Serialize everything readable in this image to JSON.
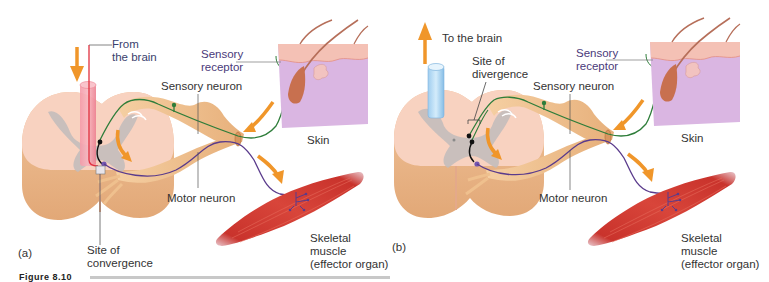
{
  "figure": {
    "colors": {
      "spinal_cord": "#f6c9b5",
      "spinal_cord_side": "#e9b58f",
      "gray_matter": "#bdb8b8",
      "nerve": "#efc08e",
      "sensory_neuron": "#2e7d3a",
      "motor_neuron": "#5a3b8c",
      "interneuron": "#111111",
      "arrow": "#f0962a",
      "descending_tract": "#f08a9a",
      "ascending_tract": "#a9d4f2",
      "skin_top": "#f6bfb3",
      "skin_body": "#d7b2df",
      "muscle": "#d6382f"
    },
    "panels": [
      {
        "id": "a",
        "panel_label": "(a)",
        "tract_label": "From\nthe brain",
        "tract_label_line1": "From",
        "tract_label_line2": "the brain",
        "site_label_line1": "Site of",
        "site_label_line2": "convergence",
        "sensory_receptor_line1": "Sensory",
        "sensory_receptor_line2": "receptor",
        "sensory_neuron": "Sensory neuron",
        "motor_neuron": "Motor neuron",
        "skin": "Skin",
        "muscle_line1": "Skeletal",
        "muscle_line2": "muscle",
        "muscle_line3": "(effector organ)"
      },
      {
        "id": "b",
        "panel_label": "(b)",
        "tract_label_line1": "To the brain",
        "site_label_line1": "Site of",
        "site_label_line2": "divergence",
        "sensory_receptor_line1": "Sensory",
        "sensory_receptor_line2": "receptor",
        "sensory_neuron": "Sensory neuron",
        "motor_neuron": "Motor neuron",
        "skin": "Skin",
        "muscle_line1": "Skeletal",
        "muscle_line2": "muscle",
        "muscle_line3": "(effector organ)"
      }
    ],
    "caption_partial": "Figure 8.10"
  }
}
